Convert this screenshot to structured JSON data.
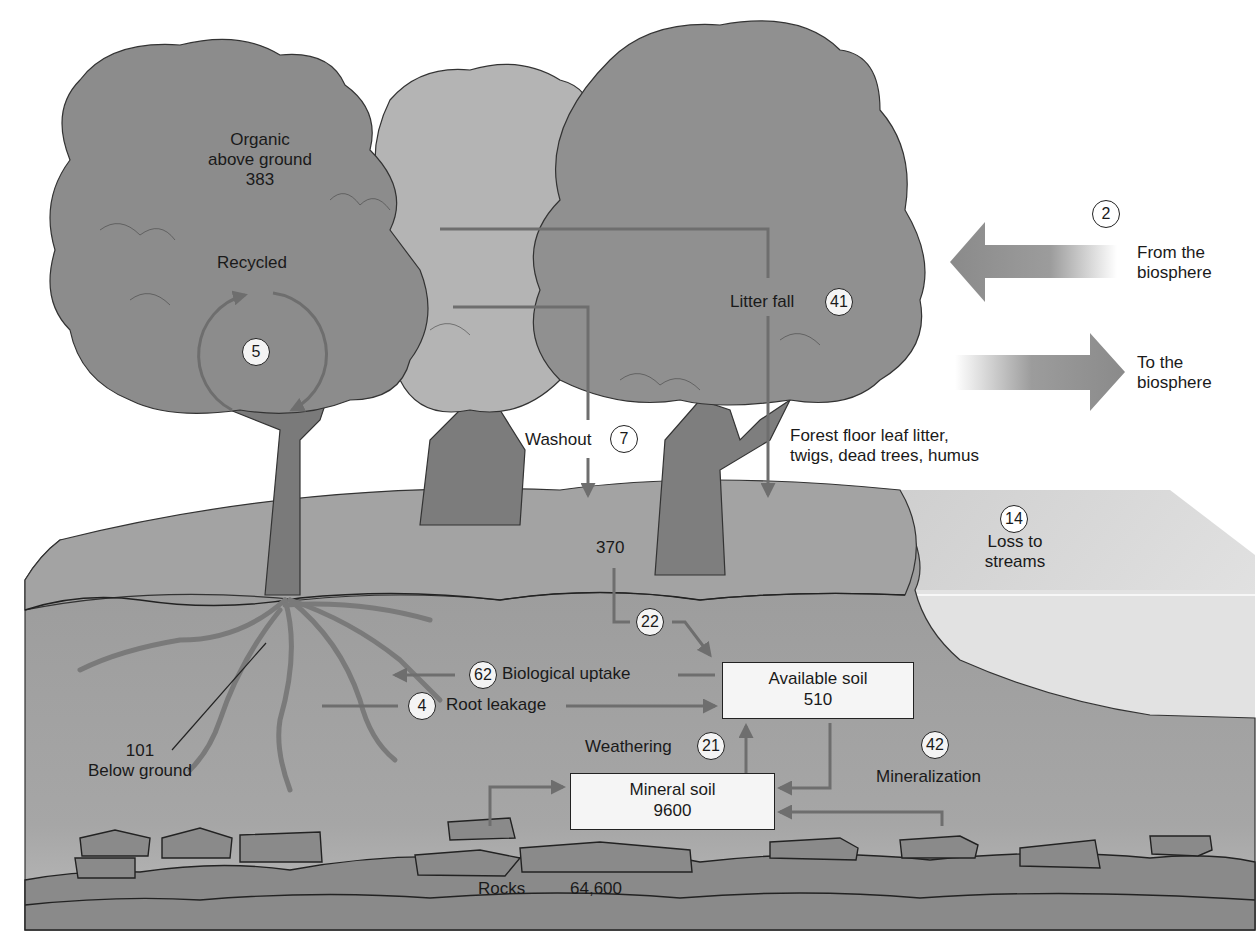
{
  "colors": {
    "foliage_dark": "#8c8c8c",
    "foliage_light": "#b4b4b4",
    "trunk": "#7a7a7a",
    "soil": "#9a9a9a",
    "ground": "#a3a3a3",
    "rocks": "#8a8a8a",
    "stream": "#d6d6d6",
    "flow_arrow": "#6e6e6e",
    "box_fill": "#f5f5f5",
    "badge_fill": "#f4f4f4"
  },
  "pools": {
    "organic_above": {
      "line1": "Organic",
      "line2": "above ground",
      "value": "383"
    },
    "below_ground": {
      "value": "101",
      "label": "Below ground"
    },
    "forest_floor": {
      "line1": "Forest floor leaf litter,",
      "line2": "twigs, dead trees, humus",
      "value": "370"
    },
    "available_soil": {
      "label": "Available soil",
      "value": "510"
    },
    "mineral_soil": {
      "label": "Mineral soil",
      "value": "9600"
    },
    "rocks": {
      "label": "Rocks",
      "value": "64,600"
    }
  },
  "flows": {
    "recycled": {
      "label": "Recycled",
      "value": "5"
    },
    "litter_fall": {
      "label": "Litter fall",
      "value": "41"
    },
    "washout": {
      "label": "Washout",
      "value": "7"
    },
    "from_biosphere": {
      "line1": "From the",
      "line2": "biosphere",
      "value": "2"
    },
    "to_biosphere": {
      "line1": "To the",
      "line2": "biosphere"
    },
    "loss_to_streams": {
      "line1": "Loss to",
      "line2": "streams",
      "value": "14"
    },
    "floor_to_available": {
      "value": "22"
    },
    "biological_uptake": {
      "label": "Biological uptake",
      "value": "62"
    },
    "root_leakage": {
      "label": "Root leakage",
      "value": "4"
    },
    "weathering": {
      "label": "Weathering",
      "value": "21"
    },
    "mineralization": {
      "label": "Mineralization",
      "value": "42"
    }
  }
}
